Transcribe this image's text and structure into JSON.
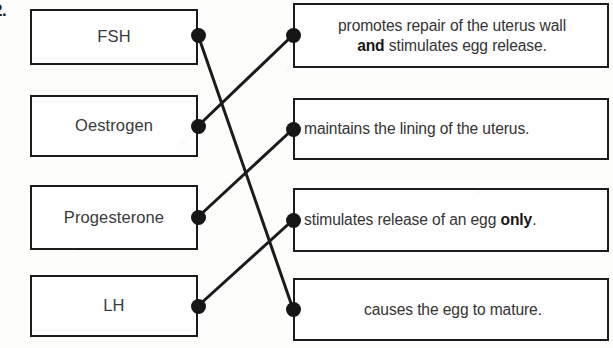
{
  "question": {
    "number": "2.",
    "type": "matching-exercise"
  },
  "colors": {
    "ink": "#1b1b1b",
    "text": "#343434",
    "paper": "#fdfdfc",
    "dot": "#161616"
  },
  "left_column": {
    "items": [
      {
        "id": "fsh",
        "label": "FSH",
        "x": 30,
        "y": 9,
        "w": 168,
        "h": 56
      },
      {
        "id": "oestrogen",
        "label": "Oestrogen",
        "x": 30,
        "y": 95,
        "w": 168,
        "h": 62
      },
      {
        "id": "progesterone",
        "label": "Progesterone",
        "x": 30,
        "y": 185,
        "w": 168,
        "h": 65
      },
      {
        "id": "lh",
        "label": "LH",
        "x": 30,
        "y": 275,
        "w": 168,
        "h": 62
      }
    ]
  },
  "right_column": {
    "items": [
      {
        "id": "repair-and-release",
        "line1": "promotes repair of the uterus wall",
        "line2_pre": "",
        "line2_bold": "and",
        "line2_post": " stimulates egg release.",
        "two_line": true,
        "centered": false,
        "x": 293,
        "y": 3,
        "w": 316,
        "h": 65
      },
      {
        "id": "maintains-lining",
        "line1": "maintains the lining of the uterus.",
        "line2_pre": "",
        "line2_bold": "",
        "line2_post": "",
        "two_line": false,
        "centered": false,
        "x": 293,
        "y": 98,
        "w": 316,
        "h": 62
      },
      {
        "id": "release-egg-only",
        "line1_pre": "stimulates release of an egg ",
        "line1_bold": "only",
        "line1_post": ".",
        "two_line": false,
        "centered": false,
        "x": 293,
        "y": 188,
        "w": 316,
        "h": 64
      },
      {
        "id": "egg-to-mature",
        "line1": "causes the egg to mature.",
        "two_line": false,
        "centered": true,
        "x": 293,
        "y": 278,
        "w": 316,
        "h": 63
      }
    ]
  },
  "connector_dots": {
    "left": [
      {
        "id": "dot-fsh",
        "x": 198,
        "y": 35
      },
      {
        "id": "dot-oestrogen",
        "x": 198,
        "y": 126
      },
      {
        "id": "dot-progesterone",
        "x": 198,
        "y": 217
      },
      {
        "id": "dot-lh",
        "x": 198,
        "y": 306
      }
    ],
    "right": [
      {
        "id": "dot-repair-and-release",
        "x": 293,
        "y": 35
      },
      {
        "id": "dot-maintains-lining",
        "x": 293,
        "y": 129
      },
      {
        "id": "dot-release-egg-only",
        "x": 293,
        "y": 220
      },
      {
        "id": "dot-egg-to-mature",
        "x": 293,
        "y": 309
      }
    ]
  },
  "connections": [
    {
      "id": "link-fsh-to-egg-to-mature",
      "from": "fsh",
      "to": "egg-to-mature",
      "x1": 198,
      "y1": 35,
      "x2": 293,
      "y2": 309
    },
    {
      "id": "link-oestrogen-to-repair-and-release",
      "from": "oestrogen",
      "to": "repair-and-release",
      "x1": 198,
      "y1": 126,
      "x2": 293,
      "y2": 35
    },
    {
      "id": "link-progesterone-to-maintains",
      "from": "progesterone",
      "to": "maintains-lining",
      "x1": 198,
      "y1": 217,
      "x2": 293,
      "y2": 129
    },
    {
      "id": "link-lh-to-release-egg-only",
      "from": "lh",
      "to": "release-egg-only",
      "x1": 198,
      "y1": 306,
      "x2": 293,
      "y2": 220
    }
  ]
}
